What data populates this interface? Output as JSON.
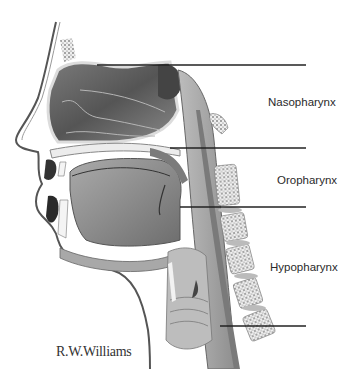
{
  "diagram": {
    "labels": [
      {
        "text": "Nasopharynx",
        "x": 268,
        "y": 96
      },
      {
        "text": "Oropharynx",
        "x": 277,
        "y": 174
      },
      {
        "text": "Hypopharynx",
        "x": 270,
        "y": 261
      }
    ],
    "leader_lines": [
      {
        "name": "upper-nasopharynx-line",
        "x1": 97,
        "x2": 306,
        "y": 65
      },
      {
        "name": "nasopharynx-oropharynx-line",
        "x1": 170,
        "x2": 306,
        "y": 148
      },
      {
        "name": "oropharynx-hypopharynx-line",
        "x1": 180,
        "x2": 306,
        "y": 207
      },
      {
        "name": "lower-hypopharynx-line",
        "x1": 220,
        "x2": 306,
        "y": 326
      }
    ],
    "signature": "R.W.Williams",
    "colors": {
      "background": "#ffffff",
      "line": "#222222",
      "cavity_dark": "#5a5a5a",
      "tissue_mid": "#9a9a9a",
      "tissue_light": "#d4d4d4",
      "bone": "#eeeeee"
    }
  }
}
